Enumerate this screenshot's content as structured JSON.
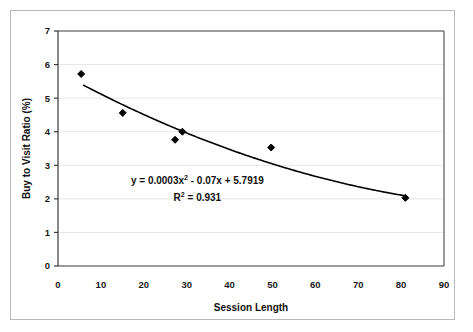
{
  "chart_data": {
    "type": "scatter",
    "title": "",
    "subtitle": "",
    "xlabel": "Session Length",
    "ylabel": "Buy to Visit Ratio (%)",
    "xlim": [
      0,
      90
    ],
    "ylim": [
      0,
      7
    ],
    "xticks": [
      "0",
      "10",
      "20",
      "30",
      "40",
      "50",
      "60",
      "70",
      "80",
      "90"
    ],
    "xtick_values": [
      0,
      10,
      20,
      30,
      40,
      50,
      60,
      70,
      80,
      90
    ],
    "yticks": [
      "0",
      "1",
      "2",
      "3",
      "4",
      "5",
      "6",
      "7"
    ],
    "ytick_values": [
      0,
      1,
      2,
      3,
      4,
      5,
      6,
      7
    ],
    "grid": "horizontal-only",
    "legend": "none",
    "marker_shape": "diamond",
    "marker_color": "#000000",
    "series": [
      {
        "name": "Buy to Visit Ratio",
        "points": [
          {
            "x": 5.4,
            "y": 5.72
          },
          {
            "x": 15.1,
            "y": 4.56
          },
          {
            "x": 27.3,
            "y": 3.76
          },
          {
            "x": 29.0,
            "y": 4.0
          },
          {
            "x": 49.7,
            "y": 3.53
          },
          {
            "x": 81.0,
            "y": 2.03
          }
        ]
      }
    ],
    "trendline": {
      "type": "polynomial",
      "order": 2,
      "a": 0.0003,
      "b": -0.07,
      "c": 5.7919,
      "x_start": 6,
      "x_end": 81,
      "color": "#000000"
    },
    "annotations": {
      "equation_prefix": "y = 0.0003x",
      "equation_exponent": "2",
      "equation_suffix": " - 0.07x + 5.7919",
      "r_squared_prefix": "R",
      "r_squared_exponent": "2",
      "r_squared_suffix": " = 0.931"
    },
    "notes": {
      "last_xtick_clipped": "90"
    }
  },
  "colors": {
    "frame": "#b9b9b9",
    "axis": "#3a3a3a",
    "gridline": "#e6e6e6",
    "marker": "#000000",
    "trendline": "#000000",
    "background": "#ffffff"
  }
}
